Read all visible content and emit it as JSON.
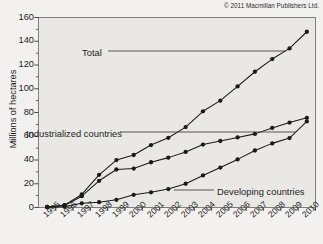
{
  "credit": "© 2011 Macmillan Publishers Ltd.",
  "chart_data": {
    "type": "line",
    "title": "",
    "xlabel": "",
    "ylabel": "Millions of hectares",
    "ylim": [
      0,
      160
    ],
    "ytick_step": 20,
    "yticks": [
      0,
      20,
      40,
      60,
      80,
      100,
      120,
      140,
      160
    ],
    "minor_ytick_step": 10,
    "grid": false,
    "legend": "inline-annotations",
    "categories": [
      "1995",
      "1996",
      "1997",
      "1998",
      "1999",
      "2000",
      "2001",
      "2002",
      "2003",
      "2004",
      "2005",
      "2006",
      "2007",
      "2008",
      "2009",
      "2010"
    ],
    "series": [
      {
        "name": "Total",
        "color": "#1a1a1a",
        "marker": "circle",
        "values": [
          0.5,
          2.0,
          11.0,
          27.5,
          39.9,
          44.2,
          52.6,
          58.7,
          67.7,
          81.0,
          90.0,
          102.0,
          114.3,
          125.0,
          134.0,
          148.0
        ]
      },
      {
        "name": "Industrialized countries",
        "color": "#1a1a1a",
        "marker": "circle",
        "values": [
          0.5,
          1.7,
          9.5,
          22.5,
          32.0,
          32.8,
          38.1,
          42.0,
          46.8,
          53.0,
          56.0,
          59.0,
          62.0,
          67.0,
          71.5,
          75.5
        ]
      },
      {
        "name": "Developing countries",
        "color": "#1a1a1a",
        "marker": "circle",
        "values": [
          0.2,
          0.6,
          3.5,
          4.5,
          6.5,
          10.7,
          12.8,
          15.5,
          20.0,
          27.0,
          33.6,
          40.5,
          48.0,
          54.0,
          58.5,
          72.5
        ]
      }
    ],
    "annotations": [
      {
        "text": "Total",
        "series": "Total"
      },
      {
        "text": "Industrialized countries",
        "series": "Industrialized countries"
      },
      {
        "text": "Developing countries",
        "series": "Developing countries"
      }
    ]
  }
}
